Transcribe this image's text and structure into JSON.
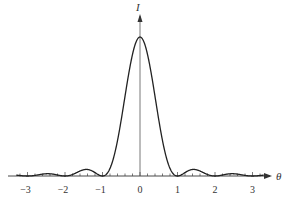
{
  "chart_data": {
    "type": "line",
    "title": "",
    "xlabel": "θ",
    "ylabel": "I",
    "xlim": [
      -3.3,
      3.3
    ],
    "ylim": [
      0,
      1
    ],
    "x_ticks": [
      -3,
      -2,
      -1,
      0,
      1,
      2,
      3
    ],
    "x_tick_labels": [
      "−3",
      "−2",
      "−1",
      "0",
      "1",
      "2",
      "3"
    ],
    "grid": false,
    "legend": null,
    "series": [
      {
        "name": "I(θ) = (sin(πθ)/(πθ))²",
        "function": "sinc_squared",
        "x": [
          -3,
          -2.5,
          -2,
          -1.43,
          -1,
          -0.5,
          0,
          0.5,
          1,
          1.43,
          2,
          2.5,
          3
        ],
        "values": [
          0,
          0.016,
          0,
          0.047,
          0,
          0.405,
          1,
          0.405,
          0,
          0.047,
          0,
          0.016,
          0
        ]
      }
    ],
    "annotations": [
      "zeros at θ = ±1, ±2, ±3",
      "central maximum at θ = 0"
    ]
  },
  "labels": {
    "y_axis": "I",
    "x_axis": "θ",
    "ticks": [
      "−3",
      "−2",
      "−1",
      "0",
      "1",
      "2",
      "3"
    ]
  }
}
